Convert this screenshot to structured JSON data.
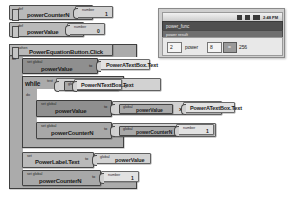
{
  "app": {
    "title": "App Inventor Blocks Editor - Power Equation"
  },
  "blocks": {
    "global_init_1": {
      "keyword": "def",
      "name": "powerCounterN",
      "as_label": "as",
      "value_type": "number",
      "value": "1"
    },
    "global_init_2": {
      "keyword": "def",
      "name": "powerValue",
      "as_label": "as",
      "value_type": "number",
      "value": "0"
    },
    "event": {
      "keyword": "when",
      "name": "PowerEquationButton.Click",
      "do_label": "do"
    },
    "set_power_value_init": {
      "setter": "set global",
      "name": "powerValue",
      "to_label": "to",
      "value": "PowerATextBox.Text"
    },
    "while_loop": {
      "keyword": "while",
      "test_label": "test",
      "do_label": "do",
      "test_left_getter": "global",
      "test_left_name": "powerCounterN",
      "operator": "<",
      "test_right": "PowerNTextBox.Text"
    },
    "set_power_value_loop": {
      "setter": "set global",
      "name": "powerValue",
      "to_label": "to",
      "arg_left_getter": "global",
      "arg_left_name": "powerValue",
      "operator": "x",
      "arg_right": "PowerATextBox.Text"
    },
    "set_counter_loop": {
      "setter": "set global",
      "name": "powerCounterN",
      "to_label": "to",
      "arg_left_getter": "global",
      "arg_left_name": "powerCounterN",
      "operator": "+",
      "arg_right_type": "number",
      "arg_right_value": "1"
    },
    "set_label": {
      "setter": "set",
      "name": "PowerLabel.Text",
      "to_label": "to",
      "value_getter": "global",
      "value_name": "powerValue"
    },
    "set_counter_reset": {
      "setter": "set global",
      "name": "powerCounterN",
      "to_label": "to",
      "value_type": "number",
      "value": "1"
    }
  },
  "emulator": {
    "status_time": "2:48 PM",
    "app_title": "power_func",
    "sub_title": "power result",
    "field_a_value": "2",
    "power_label": "power",
    "field_n_value": "8",
    "button_label": "=",
    "result_value": "256"
  },
  "colors": {
    "block_fill": "#b9b9b9",
    "block_fill_dark": "#8f8f8f",
    "block_fill_light": "#d2d2d2",
    "block_border": "#4a4a4a",
    "phone_titlebar": "#4f4f4f",
    "text": "#1c1c1c"
  }
}
